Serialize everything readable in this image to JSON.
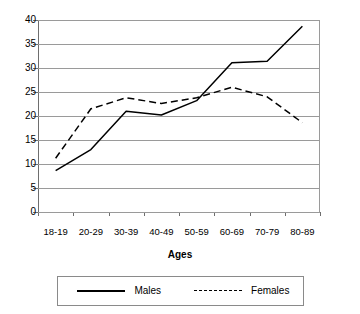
{
  "chart_data": {
    "type": "line",
    "title": "",
    "subtitle": "",
    "xlabel": "Ages",
    "ylabel": "",
    "categories": [
      "18-19",
      "20-29",
      "30-39",
      "40-49",
      "50-59",
      "60-69",
      "70-79",
      "80-89"
    ],
    "series": [
      {
        "name": "Males",
        "style": "solid",
        "values": [
          8.6,
          13.0,
          21.0,
          20.2,
          23.2,
          31.1,
          31.4,
          38.7
        ]
      },
      {
        "name": "Females",
        "style": "dashed",
        "values": [
          11.2,
          21.5,
          23.8,
          22.6,
          23.8,
          26.0,
          24.0,
          18.6
        ]
      }
    ],
    "ylim": [
      0,
      40
    ],
    "ytick_step": 5,
    "yticks": [
      "0",
      "5",
      "10",
      "15",
      "20",
      "25",
      "30",
      "35",
      "40"
    ],
    "grid": "horizontal",
    "legend_position": "bottom",
    "colors": {
      "series_line": "#000000",
      "gridline": "#9a9a9a",
      "axis": "#6e6e6e",
      "background": "#ffffff"
    }
  }
}
